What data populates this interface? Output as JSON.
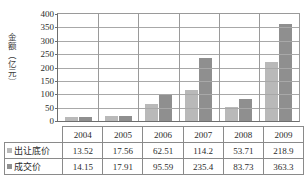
{
  "chart_data": {
    "type": "bar",
    "title": "",
    "xlabel": "",
    "ylabel": "金额（亿元）",
    "categories": [
      "2004",
      "2005",
      "2006",
      "2007",
      "2008",
      "2009"
    ],
    "series": [
      {
        "name": "出让底价",
        "color": "#b9b9b9",
        "values": [
          13.52,
          17.56,
          62.51,
          114.2,
          53.71,
          218.9
        ]
      },
      {
        "name": "成交价",
        "color": "#8f8f8f",
        "values": [
          14.15,
          17.91,
          95.59,
          235.4,
          83.73,
          363.3
        ]
      }
    ],
    "ylim": [
      0,
      400
    ],
    "yticks": [
      0,
      50,
      100,
      150,
      200,
      250,
      300,
      350,
      400
    ],
    "ytick_labels": [
      "0",
      "50",
      "100",
      "150",
      "200",
      "250",
      "300",
      "350",
      "400"
    ],
    "grid": true,
    "legend_position": "data-table-row-headers"
  },
  "data_table": {
    "corner_label": "",
    "column_headers": [
      "2004",
      "2005",
      "2006",
      "2007",
      "2008",
      "2009"
    ],
    "rows": [
      {
        "label": "出让底价",
        "marker": "legend-swatch-series-0",
        "cells": [
          "13.52",
          "17.56",
          "62.51",
          "114.2",
          "53.71",
          "218.9"
        ]
      },
      {
        "label": "成交价",
        "marker": "legend-swatch-series-1",
        "cells": [
          "14.15",
          "17.91",
          "95.59",
          "235.4",
          "83.73",
          "363.3"
        ]
      }
    ]
  },
  "colors": {
    "series_0": "#b9b9b9",
    "series_1": "#8f8f8f",
    "axis": "#6e6e6e",
    "grid": "#a8a8a8",
    "table_border": "#8a8a8a"
  }
}
